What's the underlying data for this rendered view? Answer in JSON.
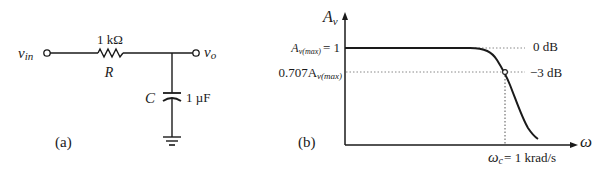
{
  "circuit": {
    "panel_label": "(a)",
    "input_label": "v",
    "input_sub": "in",
    "output_label": "v",
    "output_sub": "o",
    "resistor": {
      "symbol": "R",
      "value": "1 kΩ"
    },
    "capacitor": {
      "symbol": "C",
      "value": "1 µF"
    }
  },
  "response": {
    "panel_label": "(b)",
    "y_axis_label": "A",
    "y_axis_sub": "v",
    "x_axis_label": "ω",
    "max_gain_label": "A",
    "max_gain_sub": "v(max)",
    "max_gain_value": "= 1",
    "cutoff_gain_prefix": "0.707A",
    "cutoff_gain_sub": "v(max)",
    "zero_db_label": "0 dB",
    "minus3_db_label": "−3 dB",
    "cutoff_label": "ω",
    "cutoff_sub": "c",
    "cutoff_value": "= 1 krad/s"
  },
  "colors": {
    "ink": "#1a1a1a",
    "dotted": "#888888",
    "background": "#ffffff"
  }
}
